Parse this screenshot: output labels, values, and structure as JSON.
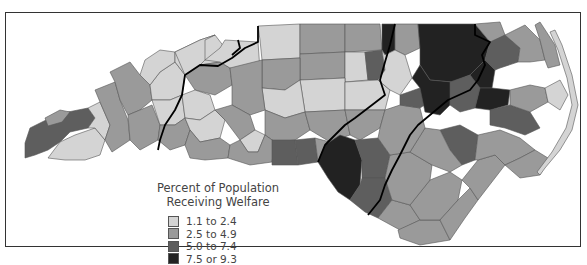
{
  "map": {
    "subject": "North Carolina counties",
    "legend": {
      "title_line1": "Percent of Population",
      "title_line2": "Receiving Welfare",
      "items": [
        {
          "label": "1.1 to 2.4",
          "color": "#d4d4d4"
        },
        {
          "label": "2.5 to 4.9",
          "color": "#9a9a9a"
        },
        {
          "label": "5.0 to 7.4",
          "color": "#5e5e5e"
        },
        {
          "label": "7.5 or 9.3",
          "color": "#222222"
        }
      ]
    },
    "colors": {
      "light": "#d4d4d4",
      "medium": "#9a9a9a",
      "dark": "#5e5e5e",
      "darkest": "#222222",
      "border": "#555555",
      "region_line": "#000000"
    }
  }
}
